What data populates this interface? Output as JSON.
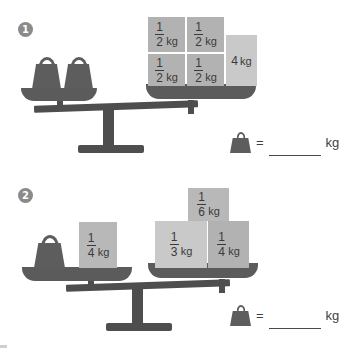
{
  "page": {
    "background_color": "#ffffff"
  },
  "colors": {
    "weight_gray": "#5d5d5d",
    "beam_gray": "#4e4e4e",
    "pan_gray": "#5b5b5b",
    "block_gray": "#b2b2b2",
    "block_light": "#c9c9c9",
    "marker_gray": "#8a8a8a",
    "text_gray": "#3a3a3a"
  },
  "problems": [
    {
      "marker": "1",
      "left_pan": {
        "weights": [
          {
            "icon": "stone-weight-icon",
            "label": ""
          },
          {
            "icon": "stone-weight-icon",
            "label": ""
          }
        ]
      },
      "right_pan": {
        "blocks": [
          {
            "numerator": "1",
            "denominator": "2",
            "unit": "kg"
          },
          {
            "numerator": "1",
            "denominator": "2",
            "unit": "kg"
          },
          {
            "numerator": "1",
            "denominator": "2",
            "unit": "kg"
          },
          {
            "numerator": "1",
            "denominator": "2",
            "unit": "kg"
          },
          {
            "whole": "4",
            "unit": "kg"
          }
        ]
      },
      "answer": {
        "icon": "stone-weight-icon",
        "equals": "=",
        "value": "",
        "unit": "kg"
      }
    },
    {
      "marker": "2",
      "left_pan": {
        "weights": [
          {
            "icon": "stone-weight-icon",
            "label": ""
          }
        ],
        "blocks": [
          {
            "numerator": "1",
            "denominator": "4",
            "unit": "kg"
          }
        ]
      },
      "right_pan": {
        "blocks": [
          {
            "numerator": "1",
            "denominator": "6",
            "unit": "kg"
          },
          {
            "numerator": "1",
            "denominator": "3",
            "unit": "kg"
          },
          {
            "numerator": "1",
            "denominator": "4",
            "unit": "kg"
          }
        ]
      },
      "answer": {
        "icon": "stone-weight-icon",
        "equals": "=",
        "value": "",
        "unit": "kg"
      }
    }
  ]
}
